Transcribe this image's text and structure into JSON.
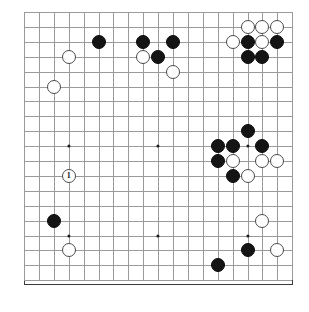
{
  "app": {
    "title": "Go Board Position",
    "board_size": 19,
    "background_color": "#ffffff",
    "board_color": "#ffffff",
    "line_color": "#9a9a9a",
    "border_color": "#3a3a3a",
    "black_color": "#141414",
    "white_color": "#ffffff"
  },
  "board": {
    "size": 19,
    "origin_x": 24,
    "origin_y": 12,
    "spacing": 14.9,
    "stone_radius": 7.0,
    "star_points": [
      {
        "col": 3,
        "row": 3
      },
      {
        "col": 9,
        "row": 3
      },
      {
        "col": 15,
        "row": 3
      },
      {
        "col": 3,
        "row": 9
      },
      {
        "col": 9,
        "row": 9
      },
      {
        "col": 15,
        "row": 9
      },
      {
        "col": 3,
        "row": 15
      },
      {
        "col": 9,
        "row": 15
      },
      {
        "col": 15,
        "row": 15
      }
    ],
    "stones": [
      {
        "col": 15,
        "row": 1,
        "color": "white",
        "label": ""
      },
      {
        "col": 16,
        "row": 1,
        "color": "white",
        "label": ""
      },
      {
        "col": 17,
        "row": 1,
        "color": "white",
        "label": ""
      },
      {
        "col": 14,
        "row": 2,
        "color": "white",
        "label": ""
      },
      {
        "col": 15,
        "row": 2,
        "color": "black",
        "label": ""
      },
      {
        "col": 16,
        "row": 2,
        "color": "white",
        "label": ""
      },
      {
        "col": 17,
        "row": 2,
        "color": "black",
        "label": ""
      },
      {
        "col": 15,
        "row": 3,
        "color": "black",
        "label": ""
      },
      {
        "col": 16,
        "row": 3,
        "color": "black",
        "label": ""
      },
      {
        "col": 5,
        "row": 2,
        "color": "black",
        "label": ""
      },
      {
        "col": 8,
        "row": 2,
        "color": "black",
        "label": ""
      },
      {
        "col": 10,
        "row": 2,
        "color": "black",
        "label": ""
      },
      {
        "col": 8,
        "row": 3,
        "color": "white",
        "label": ""
      },
      {
        "col": 9,
        "row": 3,
        "color": "black",
        "label": ""
      },
      {
        "col": 3,
        "row": 3,
        "color": "white",
        "label": ""
      },
      {
        "col": 10,
        "row": 4,
        "color": "white",
        "label": ""
      },
      {
        "col": 2,
        "row": 5,
        "color": "white",
        "label": ""
      },
      {
        "col": 15,
        "row": 8,
        "color": "black",
        "label": ""
      },
      {
        "col": 13,
        "row": 9,
        "color": "black",
        "label": ""
      },
      {
        "col": 14,
        "row": 9,
        "color": "black",
        "label": ""
      },
      {
        "col": 16,
        "row": 9,
        "color": "black",
        "label": ""
      },
      {
        "col": 13,
        "row": 10,
        "color": "black",
        "label": ""
      },
      {
        "col": 14,
        "row": 10,
        "color": "white",
        "label": ""
      },
      {
        "col": 16,
        "row": 10,
        "color": "white",
        "label": ""
      },
      {
        "col": 17,
        "row": 10,
        "color": "white",
        "label": ""
      },
      {
        "col": 14,
        "row": 11,
        "color": "black",
        "label": ""
      },
      {
        "col": 15,
        "row": 11,
        "color": "white",
        "label": ""
      },
      {
        "col": 3,
        "row": 11,
        "color": "white",
        "label": "1"
      },
      {
        "col": 2,
        "row": 14,
        "color": "black",
        "label": ""
      },
      {
        "col": 16,
        "row": 14,
        "color": "white",
        "label": ""
      },
      {
        "col": 3,
        "row": 16,
        "color": "white",
        "label": ""
      },
      {
        "col": 15,
        "row": 16,
        "color": "black",
        "label": ""
      },
      {
        "col": 17,
        "row": 16,
        "color": "white",
        "label": ""
      },
      {
        "col": 13,
        "row": 17,
        "color": "black",
        "label": ""
      }
    ],
    "move_marker": {
      "number": "1",
      "col": 3,
      "row": 11,
      "color": "white"
    }
  }
}
